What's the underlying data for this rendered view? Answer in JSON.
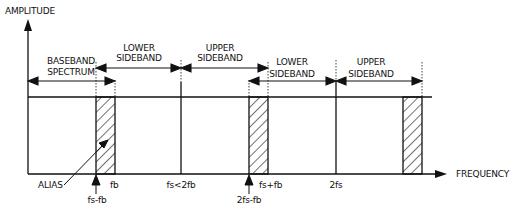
{
  "diagram": {
    "y_axis_label": "AMPLITUDE",
    "x_axis_label": "FREQUENCY",
    "bands": [
      {
        "line1": "BASEBAND",
        "line2": "SPECTRUM"
      },
      {
        "line1": "LOWER",
        "line2": "SIDEBAND"
      },
      {
        "line1": "UPPER",
        "line2": "SIDEBAND"
      },
      {
        "line1": "LOWER",
        "line2": "SIDEBAND"
      },
      {
        "line1": "UPPER",
        "line2": "SIDEBAND"
      }
    ],
    "frequency_labels": {
      "fs_minus_fb": "fs-fb",
      "fb": "fb",
      "fs": "fs<2fb",
      "two_fs_minus_fb": "2fs-fb",
      "fs_plus_fb": "fs+fb",
      "two_fs": "2fs"
    },
    "alias_label": "ALIAS",
    "colors": {
      "line": "#111111",
      "background": "#ffffff"
    }
  }
}
